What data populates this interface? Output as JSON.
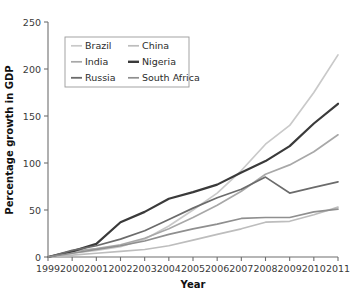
{
  "chart_data": {
    "type": "line",
    "title": "",
    "xlabel": "Year",
    "ylabel": "Percentage growth in GDP",
    "x": [
      1999,
      2000,
      2001,
      2002,
      2003,
      2004,
      2005,
      2006,
      2007,
      2008,
      2009,
      2010,
      2011
    ],
    "xtick_labels": [
      "1999",
      "2000",
      "2001",
      "2002",
      "2003",
      "2004",
      "2005",
      "2006",
      "2007",
      "2008",
      "2009",
      "2010",
      "2011"
    ],
    "ytick_labels": [
      "0",
      "50",
      "100",
      "150",
      "200",
      "250"
    ],
    "ytick_values": [
      0,
      50,
      100,
      150,
      200,
      250
    ],
    "xlim": [
      1999,
      2011
    ],
    "ylim": [
      0,
      250
    ],
    "grid": false,
    "legend_position": "upper-left-inside",
    "series": [
      {
        "name": "Brazil",
        "color": "#c9c9c9",
        "width": 1.7,
        "values": [
          0,
          4,
          7,
          11,
          19,
          33,
          50,
          68,
          92,
          120,
          140,
          175,
          215
        ]
      },
      {
        "name": "China",
        "color": "#bdbdbd",
        "width": 1.7,
        "values": [
          0,
          2,
          4,
          6,
          8,
          12,
          18,
          24,
          30,
          37,
          38,
          45,
          53
        ]
      },
      {
        "name": "India",
        "color": "#a8a8a8",
        "width": 1.7,
        "values": [
          0,
          6,
          9,
          13,
          20,
          30,
          42,
          55,
          70,
          88,
          98,
          112,
          130
        ]
      },
      {
        "name": "Nigeria",
        "color": "#3a3a3a",
        "width": 2.2,
        "values": [
          0,
          6,
          14,
          37,
          48,
          62,
          69,
          77,
          90,
          102,
          118,
          142,
          163
        ]
      },
      {
        "name": "Russia",
        "color": "#6b6b6b",
        "width": 1.7,
        "values": [
          0,
          7,
          12,
          19,
          28,
          40,
          52,
          63,
          72,
          85,
          68,
          74,
          80
        ]
      },
      {
        "name": "South Africa",
        "color": "#8f8f8f",
        "width": 1.7,
        "values": [
          0,
          4,
          8,
          12,
          17,
          24,
          30,
          35,
          41,
          42,
          42,
          48,
          51
        ]
      }
    ],
    "legend_entries": [
      {
        "label": "Brazil",
        "color": "#c9c9c9",
        "width": 1.7,
        "col": 0,
        "row": 0
      },
      {
        "label": "China",
        "color": "#bdbdbd",
        "width": 1.7,
        "col": 1,
        "row": 0
      },
      {
        "label": "India",
        "color": "#a8a8a8",
        "width": 1.7,
        "col": 0,
        "row": 1
      },
      {
        "label": "Nigeria",
        "color": "#3a3a3a",
        "width": 2.4,
        "col": 1,
        "row": 1
      },
      {
        "label": "Russia",
        "color": "#6b6b6b",
        "width": 1.8,
        "col": 0,
        "row": 2
      },
      {
        "label": "South Africa",
        "color": "#8f8f8f",
        "width": 1.7,
        "col": 1,
        "row": 2
      }
    ]
  }
}
